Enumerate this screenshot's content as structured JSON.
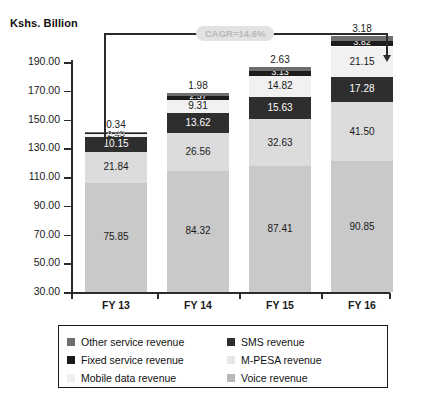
{
  "chart_data": {
    "type": "bar",
    "subtype": "stacked-column",
    "title": "",
    "ylabel": "Kshs. Billion",
    "xlabel": "",
    "categories": [
      "FY 13",
      "FY 14",
      "FY 15",
      "FY 16"
    ],
    "ylim": [
      30.0,
      190.0
    ],
    "ytick_labels": [
      "30.00",
      "50.00",
      "70.00",
      "90.00",
      "110.00",
      "130.00",
      "150.00",
      "170.00",
      "190.00"
    ],
    "ytick_values": [
      30,
      50,
      70,
      90,
      110,
      130,
      150,
      170,
      190
    ],
    "grid": false,
    "legend_position": "bottom",
    "legend_order": [
      "Other service revenue",
      "SMS revenue",
      "Fixed service revenue",
      "M-PESA revenue",
      "Mobile data revenue",
      "Voice revenue"
    ],
    "stack_order_bottom_to_top": [
      "Voice revenue",
      "Mobile data revenue",
      "SMS revenue",
      "M-PESA revenue",
      "Fixed service revenue",
      "Other service revenue"
    ],
    "series": [
      {
        "name": "Voice revenue",
        "color": "#c9c9c9",
        "label_color": "#1a1a1a",
        "values": [
          75.85,
          84.32,
          87.41,
          90.85
        ],
        "labels": [
          "75.85",
          "84.32",
          "87.41",
          "90.85"
        ]
      },
      {
        "name": "Mobile data revenue",
        "color": "#dcdcdc",
        "label_color": "#1a1a1a",
        "values": [
          21.84,
          26.56,
          32.63,
          41.5
        ],
        "labels": [
          "21.84",
          "26.56",
          "32.63",
          "41.50"
        ]
      },
      {
        "name": "SMS revenue",
        "color": "#2e2e2e",
        "label_color": "#ffffff",
        "values": [
          10.15,
          13.62,
          15.63,
          17.28
        ],
        "labels": [
          "10.15",
          "13.62",
          "15.63",
          "17.28"
        ]
      },
      {
        "name": "M-PESA revenue",
        "color": "#f1f1f1",
        "label_color": "#1a1a1a",
        "values": [
          2.45,
          9.31,
          14.82,
          21.15
        ],
        "labels": [
          "2.45",
          "9.31",
          "14.82",
          "21.15"
        ]
      },
      {
        "name": "Fixed service revenue",
        "color": "#1c1c1c",
        "label_color": "#ffffff",
        "values": [
          0.63,
          2.57,
          3.13,
          3.82
        ],
        "labels": [
          "0.63",
          "2.57",
          "3.13",
          "3.82"
        ]
      },
      {
        "name": "Other service revenue",
        "color": "#6e6e6e",
        "label_color": "#1a1a1a",
        "values": [
          0.34,
          1.98,
          2.63,
          3.18
        ],
        "labels": [
          "0.34",
          "1.98",
          "2.63",
          "3.18"
        ]
      }
    ],
    "totals": [
      111.26,
      138.36,
      156.25,
      177.78
    ],
    "annotations": [
      {
        "name": "cagr-callout",
        "text": "CAGR=14.6%",
        "from": "FY 13",
        "to": "FY 16"
      }
    ]
  },
  "legend": {
    "items": [
      {
        "label": "Other service revenue",
        "color": "#6e6e6e"
      },
      {
        "label": "SMS revenue",
        "color": "#2e2e2e"
      },
      {
        "label": "Fixed service revenue",
        "color": "#1c1c1c"
      },
      {
        "label": "M-PESA revenue",
        "color": "#e8e8e8"
      },
      {
        "label": "Mobile data revenue",
        "color": "#efefef"
      },
      {
        "label": "Voice revenue",
        "color": "#b7b7b7"
      }
    ]
  }
}
